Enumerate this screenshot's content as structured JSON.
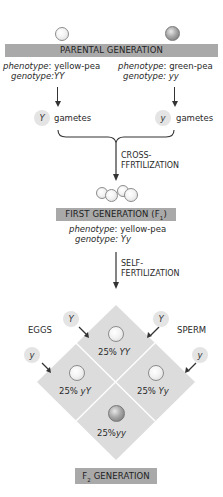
{
  "parental": {
    "bar_label": "PARENTAL GENERATION",
    "left": {
      "pea": "yellow",
      "phenotype_label": "phenotype",
      "phenotype_value": ": yellow-pea",
      "genotype_label": "genotype",
      "genotype_value": ":YY",
      "gamete": "Y",
      "gametes_label": "gametes"
    },
    "right": {
      "pea": "green",
      "phenotype_label": "phenotype",
      "phenotype_value": ": green-pea",
      "genotype_label": "genotype",
      "genotype_value": ": yy",
      "gamete": "y",
      "gametes_label": "gametes"
    }
  },
  "cross": {
    "line1": "CROSS-",
    "line2": "FFRTILIZATION"
  },
  "first": {
    "bar_label": "FIRST GENERATION (F",
    "bar_sub": "1",
    "bar_end": ")",
    "phenotype_label": "phenotype",
    "phenotype_value": ": yellow-pea",
    "genotype_label": "genotype",
    "genotype_value": ": Yy"
  },
  "self": {
    "line1": "SELF-",
    "line2": "FERTILIZATION"
  },
  "punnett": {
    "eggs_label": "EGGS",
    "sperm_label": "SPERM",
    "eggs_gametes": [
      "Y",
      "y"
    ],
    "sperm_gametes": [
      "Y",
      "y"
    ],
    "cells": [
      {
        "pct": "25%",
        "genotype": "YY",
        "pea": "yellow"
      },
      {
        "pct": "25%",
        "genotype": "yY",
        "pea": "yellow"
      },
      {
        "pct": "25%",
        "genotype": "Yy",
        "pea": "yellow"
      },
      {
        "pct": "25%",
        "genotype": "yy",
        "pea": "green"
      }
    ]
  },
  "f2": {
    "bar_prefix": "F",
    "bar_sub": "2",
    "bar_label": " GENERATION"
  },
  "colors": {
    "bar": "#a9a9a9",
    "diamond": "#dcdcdc",
    "gamete_circle": "#e4e4e4",
    "text": "#2a2a2a"
  }
}
